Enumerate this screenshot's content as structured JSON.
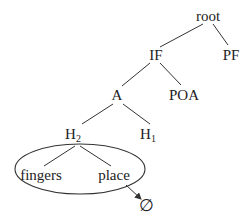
{
  "diagram": {
    "type": "tree",
    "nodes": {
      "root": {
        "label": "root"
      },
      "if": {
        "label": "IF"
      },
      "pf": {
        "label": "PF"
      },
      "a": {
        "label": "A"
      },
      "poa": {
        "label": "POA"
      },
      "h2": {
        "label": "H",
        "subscript": "2"
      },
      "h1": {
        "label": "H",
        "subscript": "1"
      },
      "fingers": {
        "label": "fingers"
      },
      "place": {
        "label": "place"
      },
      "null": {
        "label": "∅"
      }
    },
    "edges": [
      [
        "root",
        "if"
      ],
      [
        "root",
        "pf"
      ],
      [
        "if",
        "a"
      ],
      [
        "if",
        "poa"
      ],
      [
        "a",
        "h2"
      ],
      [
        "a",
        "h1"
      ],
      [
        "h2",
        "fingers"
      ],
      [
        "h2",
        "place"
      ]
    ],
    "grouping": {
      "encircled": [
        "h2-subtree: fingers, place"
      ]
    },
    "arrow": {
      "from": "place",
      "to": "null"
    },
    "colors": {
      "line": "#333333",
      "text": "#222222",
      "background": "#ffffff"
    }
  }
}
